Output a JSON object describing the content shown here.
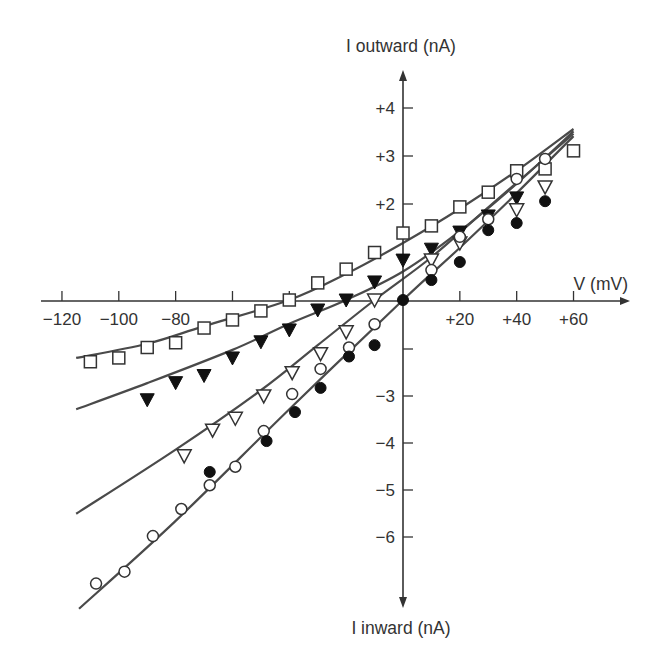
{
  "chart_data": {
    "type": "scatter",
    "title": "",
    "xlabel": "V (mV)",
    "ylabel_top": "I outward (nA)",
    "ylabel_bottom": "I inward (nA)",
    "xlim": [
      -120,
      70
    ],
    "ylim": [
      -6.5,
      4.8
    ],
    "grid": false,
    "legend": "none",
    "x_ticks": [
      {
        "value": -120,
        "label": "−120"
      },
      {
        "value": -100,
        "label": "−100"
      },
      {
        "value": -80,
        "label": "−80"
      },
      {
        "value": -60,
        "label": ""
      },
      {
        "value": -40,
        "label": ""
      },
      {
        "value": 20,
        "label": "+20"
      },
      {
        "value": 40,
        "label": "+40"
      },
      {
        "value": 60,
        "label": "+60"
      }
    ],
    "y_ticks_px": [
      {
        "y": 108,
        "label": "+4"
      },
      {
        "y": 156,
        "label": "+3"
      },
      {
        "y": 204,
        "label": "+2"
      },
      {
        "y": 349,
        "label": ""
      },
      {
        "y": 396,
        "label": "−3"
      },
      {
        "y": 443,
        "label": "−4"
      },
      {
        "y": 490,
        "label": "−5"
      },
      {
        "y": 537,
        "label": "−6"
      }
    ],
    "series": [
      {
        "name": "open squares",
        "marker": "square-open",
        "x": [
          -110,
          -100,
          -90,
          -80,
          -70,
          -60,
          -50,
          -40,
          -30,
          -20,
          -10,
          0,
          10,
          20,
          30,
          40,
          50,
          60
        ],
        "y": [
          -1.3,
          -1.22,
          -1.0,
          -0.9,
          -0.59,
          -0.42,
          -0.23,
          0.0,
          0.36,
          0.65,
          1.0,
          1.41,
          1.56,
          1.96,
          2.27,
          2.72,
          2.76,
          3.14
        ]
      },
      {
        "name": "filled triangles",
        "marker": "triangle-down-filled",
        "x": [
          -90,
          -80,
          -70,
          -60,
          -50,
          -40,
          -30,
          -20,
          -10,
          0,
          10,
          20,
          30,
          40
        ],
        "y": [
          -2.1,
          -1.74,
          -1.59,
          -1.22,
          -0.88,
          -0.63,
          -0.21,
          0.0,
          0.38,
          0.84,
          1.07,
          1.43,
          1.77,
          2.15
        ]
      },
      {
        "name": "open triangles",
        "marker": "triangle-down-open",
        "x": [
          -77,
          -67,
          -59,
          -49,
          -39,
          -29,
          -20,
          -10,
          10,
          20,
          40,
          50
        ],
        "y": [
          -3.28,
          -2.74,
          -2.49,
          -2.02,
          -1.53,
          -1.13,
          -0.67,
          0.0,
          0.84,
          1.2,
          1.9,
          2.38
        ]
      },
      {
        "name": "open circles",
        "marker": "circle-open",
        "x": [
          -108,
          -98,
          -88,
          -78,
          -68,
          -59,
          -49,
          -39,
          -29,
          -19,
          -10,
          10,
          20,
          30,
          40,
          50
        ],
        "y": [
          -5.97,
          -5.72,
          -4.97,
          -4.4,
          -3.9,
          -3.51,
          -2.76,
          -1.98,
          -1.45,
          -1.0,
          -0.51,
          0.63,
          1.33,
          1.7,
          2.55,
          2.97
        ]
      },
      {
        "name": "filled circles",
        "marker": "circle-filled",
        "x": [
          -68,
          -48,
          -38,
          -29,
          -19,
          -10,
          0,
          10,
          20,
          30,
          40,
          50
        ],
        "y": [
          -3.62,
          -2.97,
          -2.36,
          -1.85,
          -1.19,
          -0.95,
          0.0,
          0.42,
          0.8,
          1.47,
          1.62,
          2.08
        ]
      }
    ],
    "fit_curves": [
      {
        "name": "squares fit",
        "points": [
          [
            -115,
            -1.22
          ],
          [
            -90,
            -0.92
          ],
          [
            -70,
            -0.55
          ],
          [
            -40,
            0.0
          ],
          [
            -20,
            0.55
          ],
          [
            0,
            1.2
          ],
          [
            20,
            1.92
          ],
          [
            40,
            2.72
          ],
          [
            60,
            3.6
          ]
        ]
      },
      {
        "name": "filled triangles fit",
        "points": [
          [
            -115,
            -2.3
          ],
          [
            -90,
            -1.75
          ],
          [
            -60,
            -1.05
          ],
          [
            -40,
            -0.5
          ],
          [
            -20,
            0.0
          ],
          [
            0,
            0.6
          ],
          [
            20,
            1.45
          ],
          [
            40,
            2.45
          ],
          [
            60,
            3.55
          ]
        ]
      },
      {
        "name": "open triangles fit",
        "points": [
          [
            -115,
            -4.5
          ],
          [
            -80,
            -3.15
          ],
          [
            -50,
            -1.9
          ],
          [
            -30,
            -0.95
          ],
          [
            -10,
            0.0
          ],
          [
            10,
            0.9
          ],
          [
            30,
            1.95
          ],
          [
            60,
            3.5
          ]
        ]
      },
      {
        "name": "circles fit",
        "points": [
          [
            -114,
            -6.5
          ],
          [
            -80,
            -4.65
          ],
          [
            -40,
            -2.3
          ],
          [
            0,
            0.0
          ],
          [
            20,
            1.1
          ],
          [
            40,
            2.25
          ],
          [
            60,
            3.45
          ]
        ]
      }
    ]
  },
  "layout": {
    "origin_px": [
      403,
      300
    ],
    "px_per_mV": 2.842,
    "px_per_nA": 47.5,
    "x_axis": {
      "x0": 41,
      "x1": 630,
      "y": 301
    },
    "y_axis": {
      "x": 403,
      "y0": 70,
      "y1": 608
    },
    "colors": {
      "ink": "#333333",
      "fit": "#4a4a4a",
      "bg": "#ffffff"
    }
  }
}
